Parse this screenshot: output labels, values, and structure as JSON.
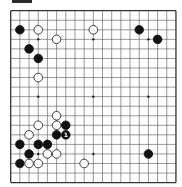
{
  "board": {
    "size": 19,
    "line_color": "#555555",
    "border_color": "#333333",
    "background": "#ffffff",
    "origin_x": 10.7,
    "origin_y": 10.7,
    "cell_w": 9.18,
    "cell_h": 9.55,
    "star_points": [
      [
        3,
        3
      ],
      [
        3,
        9
      ],
      [
        3,
        15
      ],
      [
        9,
        3
      ],
      [
        9,
        9
      ],
      [
        9,
        15
      ],
      [
        15,
        3
      ],
      [
        15,
        9
      ],
      [
        15,
        15
      ]
    ]
  },
  "stones": [
    {
      "color": "black",
      "col": 1,
      "row": 2
    },
    {
      "color": "white",
      "col": 3,
      "row": 2
    },
    {
      "color": "white",
      "col": 5,
      "row": 3
    },
    {
      "color": "black",
      "col": 2,
      "row": 4
    },
    {
      "color": "black",
      "col": 3,
      "row": 5
    },
    {
      "color": "white",
      "col": 3,
      "row": 7
    },
    {
      "color": "white",
      "col": 9,
      "row": 2
    },
    {
      "color": "black",
      "col": 14,
      "row": 2
    },
    {
      "color": "black",
      "col": 16,
      "row": 3
    },
    {
      "color": "black",
      "col": 15,
      "row": 15
    },
    {
      "color": "white",
      "col": 5,
      "row": 11
    },
    {
      "color": "white",
      "col": 5,
      "row": 12
    },
    {
      "color": "black",
      "col": 6,
      "row": 12
    },
    {
      "color": "white",
      "col": 3,
      "row": 12
    },
    {
      "color": "black",
      "col": 5,
      "row": 13
    },
    {
      "color": "black",
      "col": 6,
      "row": 13,
      "label": "1"
    },
    {
      "color": "white",
      "col": 2,
      "row": 13
    },
    {
      "color": "black",
      "col": 1,
      "row": 14
    },
    {
      "color": "black",
      "col": 3,
      "row": 14
    },
    {
      "color": "black",
      "col": 4,
      "row": 14
    },
    {
      "color": "white",
      "col": 4,
      "row": 15
    },
    {
      "color": "white",
      "col": 5,
      "row": 15
    },
    {
      "color": "black",
      "col": 2,
      "row": 15
    },
    {
      "color": "black",
      "col": 1,
      "row": 16
    },
    {
      "color": "white",
      "col": 2,
      "row": 16
    },
    {
      "color": "white",
      "col": 3,
      "row": 16
    },
    {
      "color": "white",
      "col": 8,
      "row": 16
    }
  ]
}
